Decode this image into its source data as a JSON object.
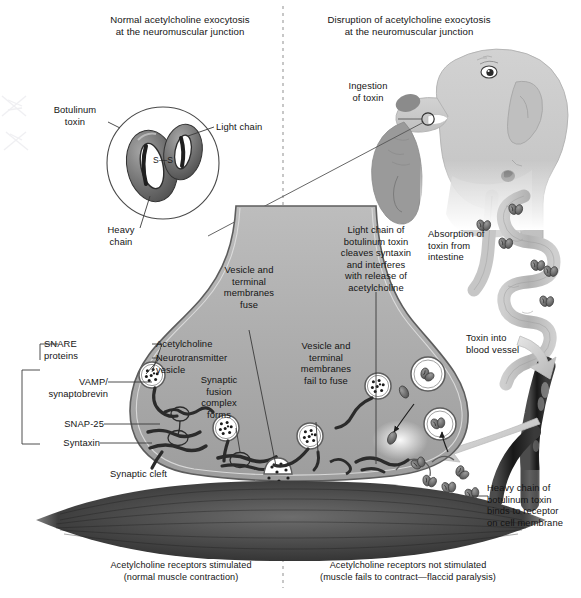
{
  "figure": {
    "title_left": "Normal acetylcholine exocytosis\nat the neuromuscular junction",
    "title_right": "Disruption of acetylcholine exocytosis\nat the neuromuscular junction"
  },
  "inset": {
    "toxin_label": "Botulinum\ntoxin",
    "light_chain": "Light chain",
    "heavy_chain": "Heavy\nchain",
    "disulfide": "S—S"
  },
  "labels": {
    "ingestion": "Ingestion\nof toxin",
    "absorption": "Absorption of\ntoxin from\nintestine",
    "blood_vessel": "Toxin into\nblood vessel",
    "heavy_chain_binds": "Heavy chain of\nbotulinum toxin\nbinds to receptor\non cell membrane",
    "light_chain_cleaves": "Light chain of\nbotulinum toxin\ncleaves syntaxin\nand interferes\nwith release of\nacetylcholine",
    "vesicle_fuse": "Vesicle and\nterminal\nmembranes\nfuse",
    "vesicle_fail": "Vesicle and\nterminal\nmembranes\nfail to fuse",
    "fusion_complex": "Synaptic\nfusion\ncomplex\nforms",
    "acetylcholine": "Acetylcholine",
    "nt_vesicle": "Neurotransmitter\nvesicle",
    "synaptic_cleft": "Synaptic cleft"
  },
  "snare": {
    "group": "SNARE\nproteins",
    "vamp": "VAMP/\nsynaptobrevin",
    "snap25": "SNAP-25",
    "syntaxin": "Syntaxin"
  },
  "captions": {
    "left": "Acetylcholine receptors stimulated\n(normal muscle contraction)",
    "right": "Acetylcholine receptors not stimulated\n(muscle fails to contract—flaccid paralysis)"
  },
  "colors": {
    "terminal_gray": "#a9a9a9",
    "terminal_edge": "#5a5a5a",
    "muscle_dark": "#4a4a4a",
    "dog_body": "#c9c9c9",
    "dog_mouth": "#8e8e8e",
    "intestine": "#b5b5b5",
    "vessel_dark": "#2a2a2a",
    "toxin_dark": "#6a6a6a",
    "line": "#333333",
    "divider": "#9a9a9a"
  }
}
